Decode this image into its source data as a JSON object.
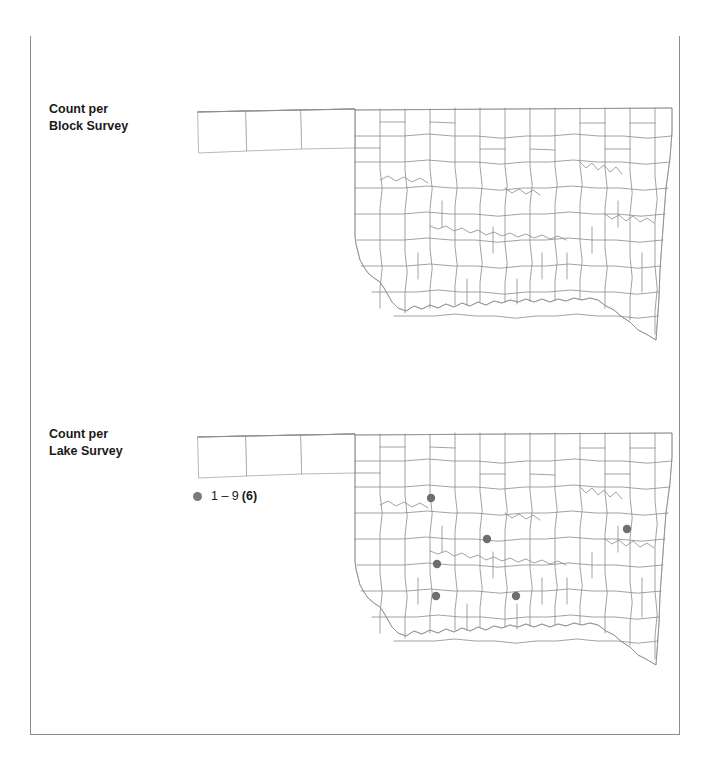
{
  "title": {
    "species": "Western Grebe",
    "main": "Oklahoma Winter Distribution, 2003–2008"
  },
  "panels": [
    {
      "id": "block-survey",
      "label": "Count per\nBlock Survey",
      "legend": [],
      "dots": []
    },
    {
      "id": "lake-survey",
      "label": "Count per\nLake Survey",
      "legend": [
        {
          "swatch_color": "#7a7a7a",
          "range": "1 – 9",
          "count": "(6)"
        }
      ],
      "dots": [
        {
          "x": 237,
          "y": 71
        },
        {
          "x": 293,
          "y": 112
        },
        {
          "x": 243,
          "y": 137
        },
        {
          "x": 242,
          "y": 169
        },
        {
          "x": 322,
          "y": 169
        },
        {
          "x": 433,
          "y": 102
        }
      ]
    }
  ],
  "colors": {
    "title_band": "#d3d3d3",
    "species_text": "#ffffff",
    "main_text": "#1a1a1a",
    "county_line": "#9b9b9b",
    "state_outline": "#8a8a8a",
    "dot": "#6f6f6f",
    "frame_border": "#8d8d8d",
    "page_background": "#ffffff"
  },
  "map": {
    "region": "Oklahoma",
    "subdivision": "counties",
    "count": 77
  }
}
